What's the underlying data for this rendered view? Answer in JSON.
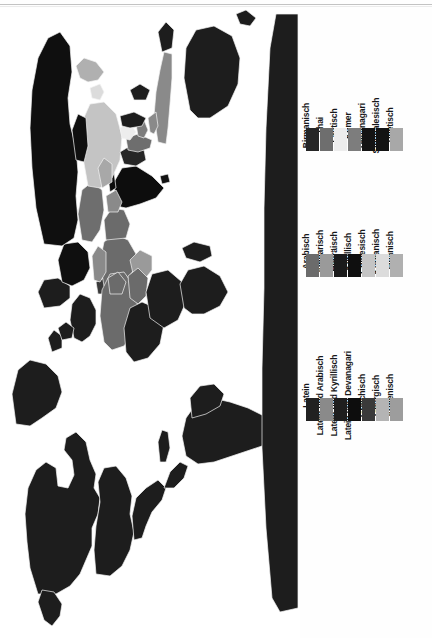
{
  "document": {
    "title": "Schriftsysteme der Welt",
    "kind": "scanned-map-figure",
    "background_color": "#fefefe"
  },
  "map": {
    "name": "world-map-writing-systems",
    "orientation": "rotated-90-ccw",
    "ocean_color": "#ffffff",
    "default_land_color": "#1d1d1d",
    "border_color": "#f4f4f4"
  },
  "legend": {
    "blocks": [
      {
        "id": "block-1",
        "name": "brahmic-and-southeast-asian-scripts",
        "items": [
          {
            "label": "Birmanisch",
            "color": "#262626"
          },
          {
            "label": "Thai",
            "color": "#6e6e6e"
          },
          {
            "label": "Laotisch",
            "color": "#ededed"
          },
          {
            "label": "Khmer",
            "color": "#7d7d7d"
          },
          {
            "label": "Devanagari",
            "color": "#141414"
          },
          {
            "label": "Singhalesisch",
            "color": "#131313"
          },
          {
            "label": "Tibetisch",
            "color": "#a8a8a8"
          }
        ]
      },
      {
        "id": "block-2",
        "name": "abjad-and-east-asian-scripts",
        "items": [
          {
            "label": "Arabisch",
            "color": "#6b6b6b"
          },
          {
            "label": "Amharisch",
            "color": "#9a9a9a"
          },
          {
            "label": "Hebräisch",
            "color": "#1b1b1b"
          },
          {
            "label": "Kyrillisch",
            "color": "#0f0f0f"
          },
          {
            "label": "Chinesisch",
            "color": "#c4c4c4"
          },
          {
            "label": "Koreanisch",
            "color": "#dcdcdc"
          },
          {
            "label": "Japanisch",
            "color": "#b0b0b0"
          }
        ]
      },
      {
        "id": "block-3",
        "name": "latin-and-european-scripts",
        "items": [
          {
            "label": "Latein",
            "color": "#212121"
          },
          {
            "label": "Latein und Arabisch",
            "color": "#8a8a8a"
          },
          {
            "label": "Latein und Kyrillisch",
            "color": "#1e1e1e"
          },
          {
            "label": "Latein und Devanagari",
            "color": "#0d0d0d"
          },
          {
            "label": "Griechisch",
            "color": "#3a3a3a"
          },
          {
            "label": "Georgisch",
            "color": "#b4b4b4"
          },
          {
            "label": "Armenisch",
            "color": "#9d9d9d"
          }
        ]
      }
    ]
  }
}
